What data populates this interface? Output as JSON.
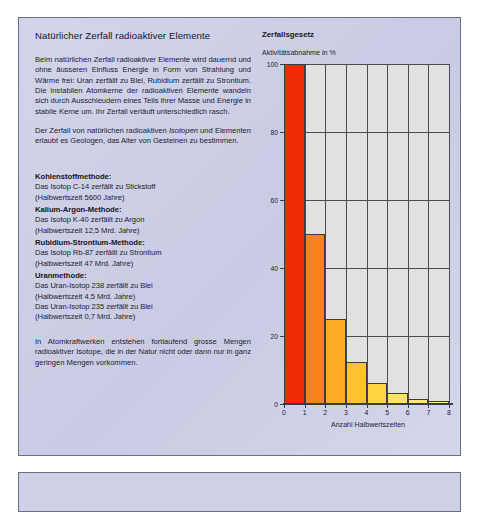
{
  "document": {
    "title": "Natürlicher Zerfall radioaktiver Elemente",
    "intro_paragraph_1": "Beim natürlichen Zerfall radioaktiver Elemente wird dauernd und ohne äusseren Einfluss Energie in Form von Strahlung und Wärme frei: Uran zerfällt zu Blei, Rubidium zerfällt zu Strontium. Die instabilen Atomkerne der radioaktiven Elemente wandeln sich durch Ausschleudern eines Teils ihrer Masse und Energie in stabile Kerne um. Ihr Zerfall verläuft unterschiedlich rasch.",
    "intro_paragraph_2_pre": "Der Zerfall von natürlichen radioaktiven ",
    "intro_paragraph_2_italic": "Isotopen",
    "intro_paragraph_2_post": " und Elementen erlaubt es Geologen, das Alter von Gesteinen zu bestimmen.",
    "closing_paragraph": "In Atomkraftwerken entstehen fortlaufend grosse Mengen radioaktiver Isotope, die in der Natur nicht oder dann nur in ganz geringen Mengen vorkommen."
  },
  "methods": [
    {
      "heading": "Kohlenstoffmethode:",
      "line1": "Das Isotop C-14 zerfällt zu Stickstoff",
      "line2": "(Halbwertszeit 5600 Jahre)"
    },
    {
      "heading": "Kalium-Argon-Methode:",
      "line1": "Das Isotop K-40 zerfällt zu Argon",
      "line2": "(Halbwertszeit 12,5 Mrd. Jahre)"
    },
    {
      "heading": "Rubidium-Strontium-Methode:",
      "line1": "Das Isotop Rb-87 zerfällt zu Strontium",
      "line2": "(Halbwertszeit 47 Mrd. Jahre)"
    },
    {
      "heading": "Uranmethode:",
      "line1": "Das Uran-Isotop 238 zerfällt zu Blei",
      "line2": "(Halbwertszeit 4,5 Mrd. Jahre)",
      "line3": "Das Uran-Isotop 235 zerfällt zu Blei",
      "line4": "(Halbwertszeit 0,7 Mrd. Jahre)"
    }
  ],
  "chart_data": {
    "type": "bar",
    "title": "Zerfallsgesetz",
    "ylabel": "Aktivitätsabnahme in %",
    "xlabel": "Anzahl Halbwertszeiten",
    "categories": [
      "0",
      "1",
      "2",
      "3",
      "4",
      "5",
      "6",
      "7"
    ],
    "values": [
      100,
      50,
      25,
      12.5,
      6.25,
      3.1,
      1.6,
      0.8
    ],
    "xticks": [
      "0",
      "1",
      "2",
      "3",
      "4",
      "5",
      "6",
      "7",
      "8"
    ],
    "yticks": [
      "0",
      "20",
      "40",
      "60",
      "80",
      "100"
    ],
    "ylim": [
      0,
      100
    ],
    "xlim": [
      0,
      8
    ],
    "grid": true,
    "legend": "none",
    "bar_colors": [
      "#f02a06",
      "#f9821b",
      "#fcac27",
      "#fdc32f",
      "#fdd743",
      "#fee458",
      "#feea6e",
      "#feef8b"
    ],
    "plot_background": "#dfe2e0"
  },
  "colors": {
    "panel_background": "#cfd1e8",
    "panel_border": "#6d6f86",
    "text": "#22222e",
    "accent_red": "#f02a06"
  }
}
